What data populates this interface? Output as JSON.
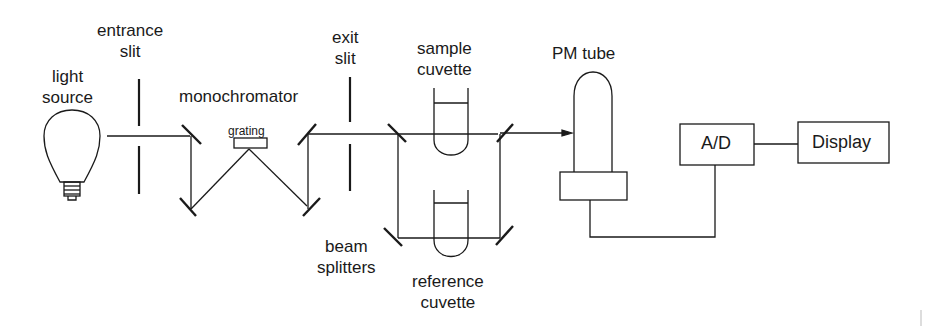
{
  "diagram": {
    "type": "optical-schematic",
    "labels": {
      "light_source": [
        "light",
        "source"
      ],
      "entrance_slit": [
        "entrance",
        "slit"
      ],
      "monochromator": "monochromator",
      "grating": "grating",
      "exit_slit": [
        "exit",
        "slit"
      ],
      "sample_cuvette": [
        "sample",
        "cuvette"
      ],
      "reference_cuvette": [
        "reference",
        "cuvette"
      ],
      "beam_splitters": [
        "beam",
        "splitters"
      ],
      "pm_tube": "PM tube",
      "ad": "A/D",
      "display": "Display"
    },
    "components": [
      "light source",
      "entrance slit",
      "monochromator (mirrors + grating)",
      "exit slit",
      "beam splitters",
      "sample cuvette",
      "reference cuvette",
      "PM tube",
      "A/D",
      "Display"
    ],
    "connections": [
      [
        "light source",
        "entrance slit"
      ],
      [
        "entrance slit",
        "monochromator"
      ],
      [
        "monochromator",
        "exit slit"
      ],
      [
        "exit slit",
        "beam splitters"
      ],
      [
        "beam splitters",
        "sample cuvette"
      ],
      [
        "beam splitters",
        "reference cuvette"
      ],
      [
        "sample cuvette",
        "PM tube"
      ],
      [
        "reference cuvette",
        "PM tube"
      ],
      [
        "PM tube",
        "A/D"
      ],
      [
        "A/D",
        "Display"
      ]
    ],
    "colors": {
      "ink": "#1a1a1a",
      "background": "#ffffff"
    }
  }
}
